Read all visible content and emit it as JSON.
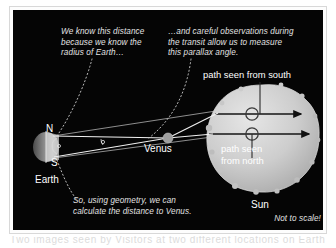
{
  "figure": {
    "not_to_scale": "Not to scale!",
    "background_color": "#050505",
    "text_color": "#e2e2e2"
  },
  "annotations": {
    "left_note": "We know this distance\nbecause we know the\nradius of Earth…",
    "right_note": "…and careful observations during\nthe transit allow us to measure\nthis parallax angle.",
    "bottom_note": "So, using geometry, we can\ncalculate the distance to Venus."
  },
  "objects": {
    "earth": {
      "label": "Earth",
      "north_label": "N",
      "south_label": "S",
      "color": "#b9b9b9"
    },
    "venus": {
      "label": "Venus",
      "color": "#9a9a9a"
    },
    "sun": {
      "label": "Sun",
      "color": "#c9c9c9"
    }
  },
  "paths": {
    "south_label": "path seen from south",
    "north_label": "path seen\nfrom north"
  },
  "caption_strip": {
    "text": "Two images seen by Visitors at two different locations on Earth"
  }
}
